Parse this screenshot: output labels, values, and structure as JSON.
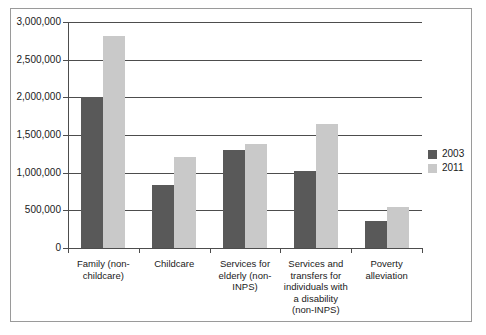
{
  "chart_data": {
    "type": "bar",
    "title": "",
    "xlabel": "",
    "ylabel": "",
    "ylim": [
      0,
      3000000
    ],
    "grid": true,
    "legend_position": "right",
    "categories": [
      "Family (non-childcare)",
      "Childcare",
      "Services for elderly (non-INPS)",
      "Services and transfers for individuals with a disability (non-INPS)",
      "Poverty alleviation"
    ],
    "category_lines": [
      [
        "Family (non-",
        "childcare)"
      ],
      [
        "Childcare"
      ],
      [
        "Services for",
        "elderly (non-",
        "INPS)"
      ],
      [
        "Services and",
        "transfers for",
        "individuals with",
        "a  disability",
        "(non-INPS)"
      ],
      [
        "Poverty",
        "alleviation"
      ]
    ],
    "series": [
      {
        "name": "2003",
        "color": "#595959",
        "values": [
          2010000,
          840000,
          1300000,
          1020000,
          360000
        ]
      },
      {
        "name": "2011",
        "color": "#c9c9c9",
        "values": [
          2820000,
          1210000,
          1380000,
          1640000,
          550000
        ]
      }
    ],
    "ytick_labels": [
      "3,000,000",
      "2,500,000",
      "2,000,000",
      "1,500,000",
      "1,000,000",
      "500,000",
      "0"
    ],
    "ytick_values": [
      3000000,
      2500000,
      2000000,
      1500000,
      1000000,
      500000,
      0
    ]
  },
  "legend": {
    "entries": [
      {
        "label": "2003",
        "color": "#595959"
      },
      {
        "label": "2011",
        "color": "#c9c9c9"
      }
    ]
  }
}
